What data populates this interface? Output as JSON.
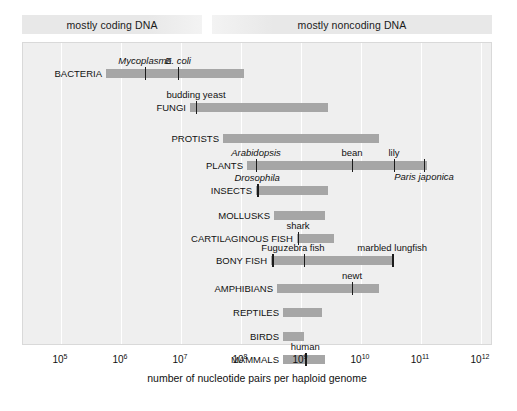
{
  "banners": [
    {
      "label": "mostly coding DNA"
    },
    {
      "label": "mostly noncoding DNA"
    }
  ],
  "axis": {
    "xlabel": "number of nucleotide pairs per haploid genome",
    "ticks": [
      "10⁵",
      "10⁶",
      "10⁷",
      "10⁸",
      "10⁹",
      "10¹⁰",
      "10¹¹",
      "10¹²"
    ],
    "tick_mantissa": [
      "10",
      "10",
      "10",
      "10",
      "10",
      "10",
      "10",
      "10"
    ],
    "tick_exponent": [
      "5",
      "6",
      "7",
      "8",
      "9",
      "10",
      "11",
      "12"
    ]
  },
  "colors": {
    "bar": "#a6a6a6",
    "plot_background": "#efefef",
    "banner": "#e8e8e8",
    "gridline": "#ffffff",
    "text": "#111111"
  },
  "chart_data": {
    "type": "bar",
    "title": "",
    "subtitle": "",
    "xlabel": "number of nucleotide pairs per haploid genome",
    "ylabel": "",
    "xscale": "log",
    "xlim": [
      100000,
      1000000000000
    ],
    "grid": true,
    "legend": "none",
    "categories": [
      "BACTERIA",
      "FUNGI",
      "PROTISTS",
      "PLANTS",
      "INSECTS",
      "MOLLUSKS",
      "CARTILAGINOUS FISH",
      "BONY FISH",
      "AMPHIBIANS",
      "REPTILES",
      "BIRDS",
      "MAMMALS"
    ],
    "ranges": [
      {
        "group": "BACTERIA",
        "log_min": 5.75,
        "log_max": 8.05,
        "markers": [
          {
            "label": "Mycoplasma",
            "log_x": 6.4,
            "italic": true,
            "side": "above"
          },
          {
            "label": "E. coli",
            "log_x": 6.95,
            "italic": true,
            "side": "above"
          }
        ]
      },
      {
        "group": "FUNGI",
        "log_min": 7.15,
        "log_max": 9.45,
        "markers": [
          {
            "label": "budding yeast",
            "log_x": 7.25,
            "italic": false,
            "side": "above"
          }
        ]
      },
      {
        "group": "PROTISTS",
        "log_min": 7.7,
        "log_max": 10.3,
        "markers": []
      },
      {
        "group": "PLANTS",
        "log_min": 8.1,
        "log_max": 11.1,
        "markers": [
          {
            "label": "Arabidopsis",
            "log_x": 8.25,
            "italic": true,
            "side": "above"
          },
          {
            "label": "bean",
            "log_x": 9.85,
            "italic": false,
            "side": "above"
          },
          {
            "label": "lily",
            "log_x": 10.55,
            "italic": false,
            "side": "above"
          },
          {
            "label": "Paris japonica",
            "log_x": 11.05,
            "italic": true,
            "side": "below"
          }
        ]
      },
      {
        "group": "INSECTS",
        "log_min": 8.25,
        "log_max": 9.45,
        "markers": [
          {
            "label": "Drosophila",
            "log_x": 8.27,
            "italic": true,
            "side": "above"
          }
        ]
      },
      {
        "group": "MOLLUSKS",
        "log_min": 8.55,
        "log_max": 9.4,
        "markers": []
      },
      {
        "group": "CARTILAGINOUS FISH",
        "log_min": 8.93,
        "log_max": 9.55,
        "markers": [
          {
            "label": "shark",
            "log_x": 8.95,
            "italic": false,
            "side": "above"
          }
        ]
      },
      {
        "group": "BONY FISH",
        "log_min": 8.5,
        "log_max": 10.55,
        "markers": [
          {
            "label": "Fugu",
            "log_x": 8.52,
            "italic": false,
            "side": "above"
          },
          {
            "label": "zebra fish",
            "log_x": 9.05,
            "italic": false,
            "side": "above"
          },
          {
            "label": "marbled lungfish",
            "log_x": 10.52,
            "italic": false,
            "side": "above"
          }
        ]
      },
      {
        "group": "AMPHIBIANS",
        "log_min": 8.6,
        "log_max": 10.3,
        "markers": [
          {
            "label": "newt",
            "log_x": 9.85,
            "italic": false,
            "side": "above"
          }
        ]
      },
      {
        "group": "REPTILES",
        "log_min": 8.7,
        "log_max": 9.35,
        "markers": []
      },
      {
        "group": "BIRDS",
        "log_min": 8.7,
        "log_max": 9.05,
        "markers": []
      },
      {
        "group": "MAMMALS",
        "log_min": 8.7,
        "log_max": 9.4,
        "markers": [
          {
            "label": "human",
            "log_x": 9.07,
            "italic": false,
            "side": "above"
          }
        ]
      }
    ]
  }
}
